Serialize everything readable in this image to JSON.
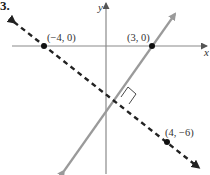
{
  "problem_number": "3.",
  "axes": {
    "x_label": "x",
    "y_label": "y"
  },
  "points": [
    {
      "label": "(−4, 0)",
      "x": -4,
      "y": 0
    },
    {
      "label": "(3, 0)",
      "x": 3,
      "y": 0
    },
    {
      "label": "(4, −6)",
      "x": 4,
      "y": -6
    }
  ],
  "lines": [
    {
      "name": "solid-line",
      "style": "solid",
      "color": "#999999",
      "through": [
        "(3, 0)"
      ]
    },
    {
      "name": "dashed-line",
      "style": "dashed",
      "color": "#222222",
      "through": [
        "(−4, 0)",
        "(4, −6)"
      ]
    }
  ],
  "annotations": {
    "right_angle_marker": true
  }
}
